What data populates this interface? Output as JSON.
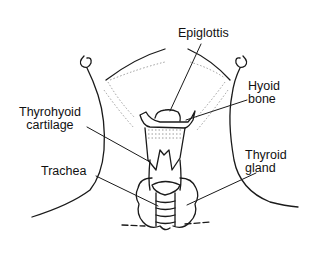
{
  "diagram": {
    "stroke_color": "#1a1a1a",
    "shading_color": "#9a9a9a",
    "labels": {
      "epiglottis": {
        "line1": "Epiglottis"
      },
      "hyoid": {
        "line1": "Hyoid",
        "line2": "bone"
      },
      "thyrohyoid": {
        "line1": "Thyrohyoid",
        "line2": "cartilage"
      },
      "trachea": {
        "line1": "Trachea"
      },
      "thyroid": {
        "line1": "Thyroid",
        "line2": "gland"
      }
    }
  }
}
